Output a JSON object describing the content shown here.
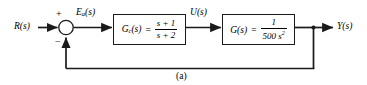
{
  "figure": {
    "caption": "(a)",
    "background_color": "#ffffff",
    "line_color": "#1a1a1a",
    "type": "control-system-block-diagram"
  },
  "signals": {
    "input": {
      "base": "R",
      "arg": "(s)",
      "full": "R(s)"
    },
    "error": {
      "base": "E",
      "subscript": "a",
      "arg": "(s)",
      "full": "Ea(s)"
    },
    "control": {
      "base": "U",
      "arg": "(s)",
      "full": "U(s)"
    },
    "output": {
      "base": "Y",
      "arg": "(s)",
      "full": "Y(s)"
    }
  },
  "summing_junction": {
    "name": "summer",
    "positive_sign": "+",
    "negative_sign": "−",
    "positive_input": "R(s)",
    "negative_input": "Y(s)"
  },
  "blocks": [
    {
      "id": "controller",
      "label_base": "G",
      "label_subscript": "c",
      "label_arg": "(s)",
      "equals": "=",
      "numerator": "s + 1",
      "denominator": "s + 2",
      "transfer_function": "Gc(s) = (s + 1)/(s + 2)"
    },
    {
      "id": "plant",
      "label_base": "G",
      "label_subscript": "",
      "label_arg": "(s)",
      "equals": "=",
      "numerator": "1",
      "denominator_coeff": "500",
      "denominator_var": "s",
      "denominator_exponent": "2",
      "transfer_function": "G(s) = 1/(500 s^2)"
    }
  ],
  "feedback": {
    "type": "unity-negative-feedback",
    "gain": "1"
  }
}
